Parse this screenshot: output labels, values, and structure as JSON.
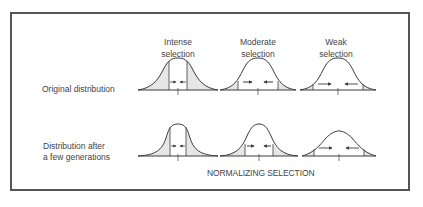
{
  "figure": {
    "caption": "NORMALIZING SELECTION",
    "columns": [
      {
        "line1": "Intense",
        "line2": "selection"
      },
      {
        "line1": "Moderate",
        "line2": "selection"
      },
      {
        "line1": "Weak",
        "line2": "selection"
      }
    ],
    "rows": [
      {
        "line1": "Original distribution",
        "line2": ""
      },
      {
        "line1": "Distribution after",
        "line2": "a few generations"
      }
    ],
    "colors": {
      "curve": "#3c3c3c",
      "shade": "#e6e6e6",
      "frame": "#555555",
      "text": "#444444"
    }
  }
}
